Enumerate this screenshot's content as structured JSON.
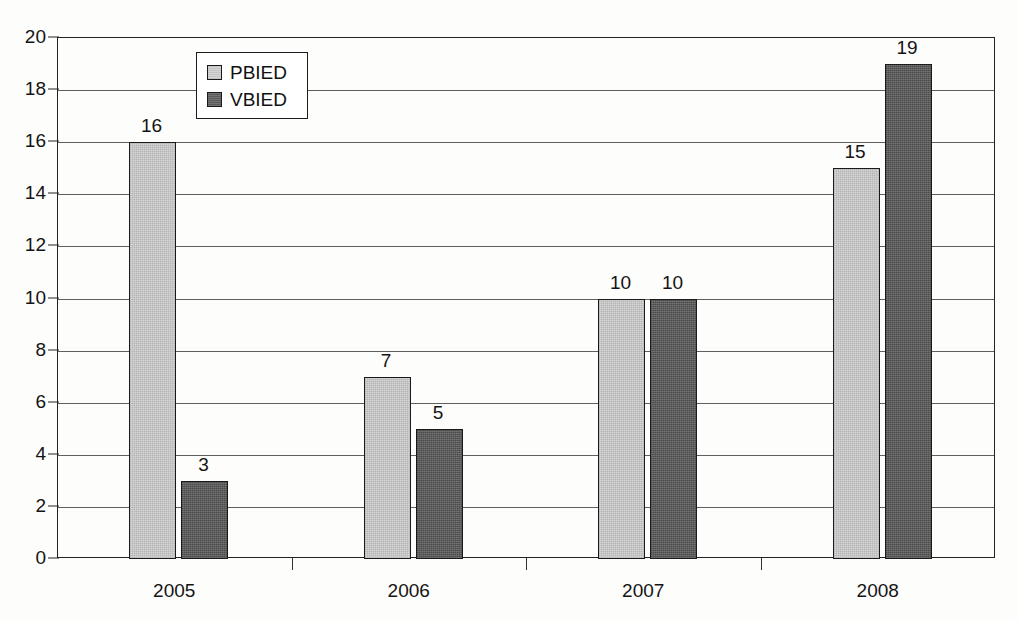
{
  "chart_data": {
    "type": "bar",
    "title": "",
    "subtitle": "",
    "xlabel": "",
    "ylabel": "",
    "categories": [
      "2005",
      "2006",
      "2007",
      "2008"
    ],
    "series": [
      {
        "name": "PBIED",
        "values": [
          16,
          7,
          10,
          15
        ],
        "color": "#d6d6d6"
      },
      {
        "name": "VBIED",
        "values": [
          3,
          5,
          10,
          19
        ],
        "color": "#5b5b5b"
      }
    ],
    "ylim": [
      0,
      20
    ],
    "ytick_labels": [
      "0",
      "2",
      "4",
      "6",
      "8",
      "10",
      "12",
      "14",
      "16",
      "18",
      "20"
    ],
    "ytick_values": [
      0,
      2,
      4,
      6,
      8,
      10,
      12,
      14,
      16,
      18,
      20
    ],
    "grid": true,
    "grid_axis": "y",
    "data_labels": true,
    "legend_position": "top-left-inside",
    "legend_entries": [
      "PBIED",
      "VBIED"
    ],
    "axis_color": "#222222",
    "grid_color": "#5f5f5f",
    "background_color": "#fdfdfc",
    "bar_border_color": "#1a1a1a"
  }
}
